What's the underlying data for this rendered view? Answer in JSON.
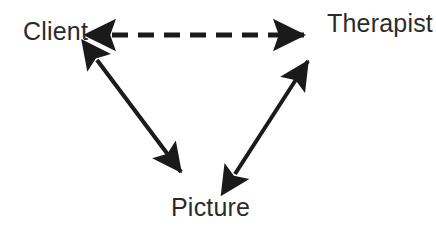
{
  "diagram": {
    "type": "triangle-relationship-diagram",
    "background_color": "#ffffff",
    "ink_color": "#1a1a1a",
    "text_color": "#2b2b2b",
    "nodes": [
      {
        "id": "client",
        "label": "Client",
        "position": "top-left",
        "x": 57,
        "y": 32
      },
      {
        "id": "therapist",
        "label": "Therapist",
        "position": "top-right",
        "x": 376,
        "y": 25
      },
      {
        "id": "picture",
        "label": "Picture",
        "position": "bottom-center",
        "x": 209,
        "y": 209
      }
    ],
    "connectors": [
      {
        "id": "client-therapist",
        "from": "client",
        "to": "therapist",
        "style": "dashed",
        "arrowheads": "both",
        "dash_length": 16,
        "gap_length": 10,
        "stroke_width": 5,
        "x1": 112,
        "y1": 35,
        "x2": 304,
        "y2": 35
      },
      {
        "id": "client-picture",
        "from": "client",
        "to": "picture",
        "style": "solid",
        "arrowheads": "both",
        "stroke_width": 4,
        "x1": 97,
        "y1": 60,
        "x2": 181,
        "y2": 172
      },
      {
        "id": "picture-therapist",
        "from": "picture",
        "to": "therapist",
        "style": "solid",
        "arrowheads": "both",
        "stroke_width": 4,
        "x1": 235,
        "y1": 174,
        "x2": 308,
        "y2": 61
      }
    ]
  }
}
